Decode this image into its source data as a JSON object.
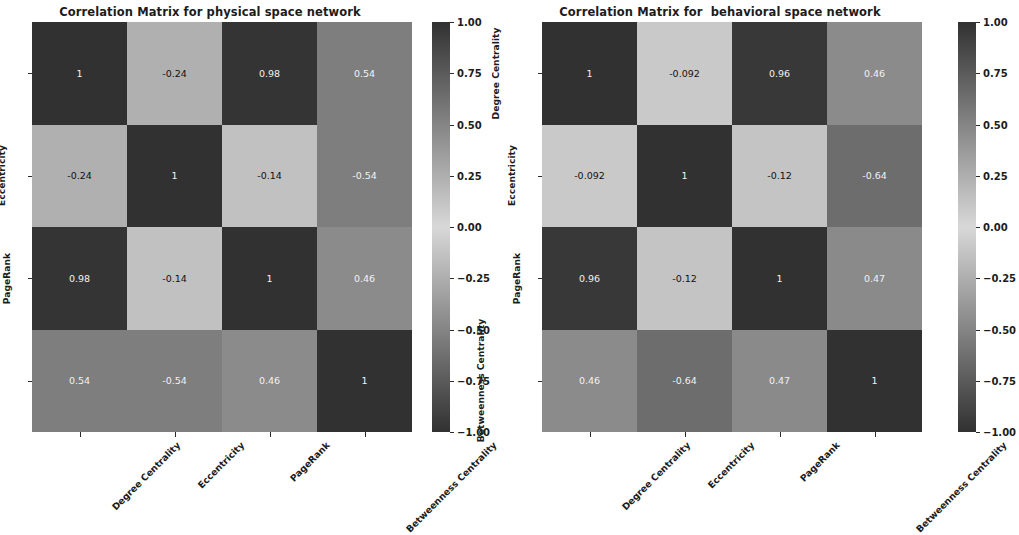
{
  "chart_data": [
    {
      "type": "heatmap",
      "title": "Correlation Matrix for physical space network",
      "xlabel": "",
      "ylabel": "",
      "categories": [
        "Degree Centrality",
        "Eccentricity",
        "PageRank",
        "Betweenness Centrality"
      ],
      "xticklabels": [
        "Degree Centrality",
        "Eccentricity",
        "PageRank",
        "Betweenness Centrality"
      ],
      "yticklabels": [
        "Degree Centrality",
        "Eccentricity",
        "PageRank",
        "Betweenness Centrality"
      ],
      "values": [
        [
          1,
          -0.24,
          0.98,
          0.54
        ],
        [
          -0.24,
          1,
          -0.14,
          -0.54
        ],
        [
          0.98,
          -0.14,
          1,
          0.46
        ],
        [
          0.54,
          -0.54,
          0.46,
          1
        ]
      ],
      "annotations": [
        [
          "1",
          "-0.24",
          "0.98",
          "0.54"
        ],
        [
          "-0.24",
          "1",
          "-0.14",
          "-0.54"
        ],
        [
          "0.98",
          "-0.14",
          "1",
          "0.46"
        ],
        [
          "0.54",
          "-0.54",
          "0.46",
          "1"
        ]
      ],
      "colorbar": {
        "ticks": [
          1.0,
          0.75,
          0.5,
          0.25,
          0.0,
          -0.25,
          -0.5,
          -0.75,
          -1.0
        ],
        "ticklabels": [
          "1.00",
          "0.75",
          "0.50",
          "0.25",
          "0.00",
          "−0.25",
          "−0.50",
          "−0.75",
          "−1.00"
        ],
        "vmin": -1.0,
        "vmax": 1.0
      },
      "grid": false,
      "legend": "none",
      "colormap": "grayscale-symmetric"
    },
    {
      "type": "heatmap",
      "title": "Correlation Matrix for  behavioral space network",
      "xlabel": "",
      "ylabel": "",
      "categories": [
        "Degree Centrality",
        "Eccentricity",
        "PageRank",
        "Betweenness Centrality"
      ],
      "xticklabels": [
        "Degree Centrality",
        "Eccentricity",
        "PageRank",
        "Betweenness Centrality"
      ],
      "yticklabels": [
        "Degree Centrality",
        "Eccentricity",
        "PageRank",
        "Betweenness Centrality"
      ],
      "values": [
        [
          1,
          -0.092,
          0.96,
          0.46
        ],
        [
          -0.092,
          1,
          -0.12,
          -0.64
        ],
        [
          0.96,
          -0.12,
          1,
          0.47
        ],
        [
          0.46,
          -0.64,
          0.47,
          1
        ]
      ],
      "annotations": [
        [
          "1",
          "-0.092",
          "0.96",
          "0.46"
        ],
        [
          "-0.092",
          "1",
          "-0.12",
          "-0.64"
        ],
        [
          "0.96",
          "-0.12",
          "1",
          "0.47"
        ],
        [
          "0.46",
          "-0.64",
          "0.47",
          "1"
        ]
      ],
      "colorbar": {
        "ticks": [
          1.0,
          0.75,
          0.5,
          0.25,
          0.0,
          -0.25,
          -0.5,
          -0.75,
          -1.0
        ],
        "ticklabels": [
          "1.00",
          "0.75",
          "0.50",
          "0.25",
          "0.00",
          "−0.25",
          "−0.50",
          "−0.75",
          "−1.00"
        ],
        "vmin": -1.0,
        "vmax": 1.0
      },
      "grid": false,
      "legend": "none",
      "colormap": "grayscale-symmetric"
    }
  ],
  "figure": {
    "background": "#ffffff",
    "text_color": "#1c1c1c",
    "dark_color": "#333333",
    "light_color": "#d4d4d4"
  }
}
